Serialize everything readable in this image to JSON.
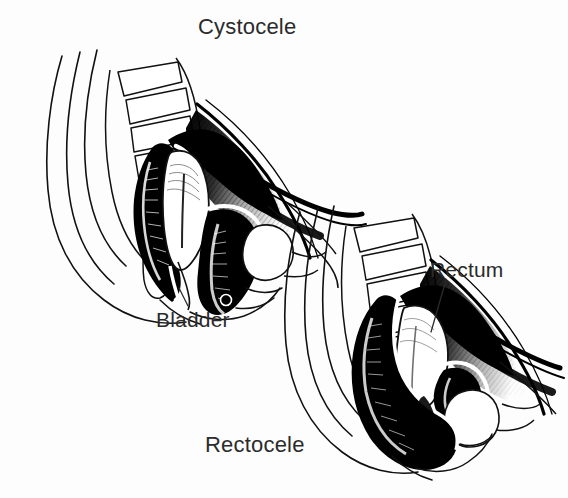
{
  "image": {
    "kind": "medical-illustration",
    "subject": "Sagittal section of the female pelvis showing pelvic organ prolapse",
    "style": "black-and-white pen-and-ink line drawing with stipple and hatch shading",
    "background_color": "#fdfdfd",
    "ink_color": "#000000",
    "text_color": "#2b2b2b"
  },
  "figures": [
    {
      "id": "cystocele",
      "caption": "Cystocele",
      "caption_position": "top",
      "description": "Left/upper pelvic diagram in which the bladder bulges downward into the vaginal canal"
    },
    {
      "id": "rectocele",
      "caption": "Rectocele",
      "caption_position": "bottom",
      "description": "Right/lower pelvic diagram in which the rectum bulges forward into the vaginal canal"
    }
  ],
  "labels": {
    "cystocele": "Cystocele",
    "bladder": "Bladder",
    "rectum": "Rectum",
    "rectocele": "Rectocele"
  },
  "leader_lines": [
    {
      "label": "bladder",
      "from": [
        188,
        306
      ],
      "to": [
        180,
        288
      ]
    },
    {
      "label": "rectum",
      "from": [
        446,
        282
      ],
      "to": [
        432,
        330
      ]
    }
  ]
}
